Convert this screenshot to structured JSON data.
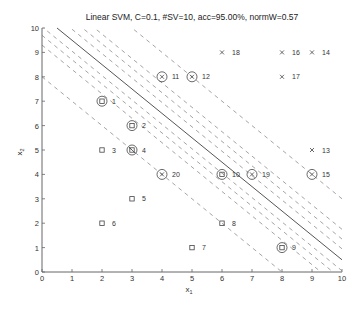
{
  "chart_data": {
    "type": "scatter",
    "title": "Linear SVM, C=0.1, #SV=10, acc=95.00%, normW=0.57",
    "xlabel": "x1",
    "ylabel": "x2",
    "xlim": [
      0,
      10
    ],
    "ylim": [
      0,
      10
    ],
    "xticks": [
      0,
      1,
      2,
      3,
      4,
      5,
      6,
      7,
      8,
      9,
      10
    ],
    "yticks": [
      0,
      1,
      2,
      3,
      4,
      5,
      6,
      7,
      8,
      9,
      10
    ],
    "grid": false,
    "points": [
      {
        "id": 1,
        "x": 2,
        "y": 7,
        "class": "square",
        "sv": true
      },
      {
        "id": 2,
        "x": 3,
        "y": 6,
        "class": "square",
        "sv": true
      },
      {
        "id": 3,
        "x": 2,
        "y": 5,
        "class": "square",
        "sv": false
      },
      {
        "id": 4,
        "x": 3,
        "y": 5,
        "class": "square",
        "sv": true,
        "misclassified": true
      },
      {
        "id": 5,
        "x": 3,
        "y": 3,
        "class": "square",
        "sv": false
      },
      {
        "id": 6,
        "x": 2,
        "y": 2,
        "class": "square",
        "sv": false
      },
      {
        "id": 7,
        "x": 5,
        "y": 1,
        "class": "square",
        "sv": false
      },
      {
        "id": 8,
        "x": 6,
        "y": 2,
        "class": "square",
        "sv": false
      },
      {
        "id": 9,
        "x": 8,
        "y": 1,
        "class": "square",
        "sv": true
      },
      {
        "id": 10,
        "x": 6,
        "y": 4,
        "class": "square",
        "sv": true
      },
      {
        "id": 11,
        "x": 4,
        "y": 8,
        "class": "cross",
        "sv": true
      },
      {
        "id": 12,
        "x": 5,
        "y": 8,
        "class": "cross",
        "sv": true
      },
      {
        "id": 13,
        "x": 9,
        "y": 5,
        "class": "cross",
        "sv": false
      },
      {
        "id": 14,
        "x": 9,
        "y": 9,
        "class": "cross",
        "sv": false
      },
      {
        "id": 15,
        "x": 9,
        "y": 4,
        "class": "cross",
        "sv": true
      },
      {
        "id": 16,
        "x": 8,
        "y": 9,
        "class": "cross",
        "sv": false
      },
      {
        "id": 17,
        "x": 8,
        "y": 8,
        "class": "cross",
        "sv": false
      },
      {
        "id": 18,
        "x": 6,
        "y": 9,
        "class": "cross",
        "sv": false
      },
      {
        "id": 19,
        "x": 7,
        "y": 4,
        "class": "cross",
        "sv": true
      },
      {
        "id": 20,
        "x": 4,
        "y": 4,
        "class": "cross",
        "sv": true
      }
    ],
    "decision_boundary": {
      "slope": -1,
      "intercept": 10.5,
      "style": "solid"
    },
    "contour_lines": [
      {
        "slope": -1,
        "intercept": 8.0,
        "style": "dashed"
      },
      {
        "slope": -1,
        "intercept": 9.3,
        "style": "dashed"
      },
      {
        "slope": -1,
        "intercept": 9.7,
        "style": "dashed"
      },
      {
        "slope": -1,
        "intercept": 10.05,
        "style": "dashed"
      },
      {
        "slope": -1,
        "intercept": 10.95,
        "style": "dashed"
      },
      {
        "slope": -1,
        "intercept": 11.35,
        "style": "dashed"
      },
      {
        "slope": -1,
        "intercept": 11.75,
        "style": "dashed"
      },
      {
        "slope": -1,
        "intercept": 13.0,
        "style": "dashed"
      }
    ],
    "legend": null
  }
}
